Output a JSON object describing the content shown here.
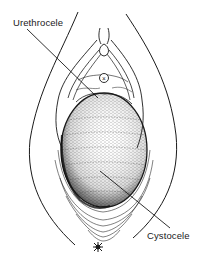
{
  "figure": {
    "type": "anatomical-line-drawing",
    "background_color": "#ffffff",
    "ink_color": "#1a1a1a"
  },
  "labels": {
    "urethrocele": "Urethrocele",
    "cystocele": "Cystocele"
  },
  "markers": {
    "urethral_meatus": "×",
    "anus": "✱"
  }
}
